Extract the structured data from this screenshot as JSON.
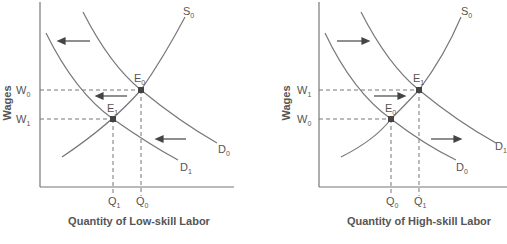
{
  "panels": [
    {
      "id": "low-skill",
      "ylabel": "Wages",
      "xlabel": "Quantity of Low-skill Labor",
      "supply": {
        "label": "S",
        "sub": "0"
      },
      "demand_orig": {
        "label": "D",
        "sub": "0"
      },
      "demand_new": {
        "label": "D",
        "sub": "1"
      },
      "eq_upper": {
        "label": "E",
        "sub": "0"
      },
      "eq_lower": {
        "label": "E",
        "sub": "1"
      },
      "w_upper": {
        "label": "W",
        "sub": "0"
      },
      "w_lower": {
        "label": "W",
        "sub": "1"
      },
      "q_left": {
        "label": "Q",
        "sub": "1"
      },
      "q_right": {
        "label": "Q",
        "sub": "0"
      },
      "shift_direction": "left"
    },
    {
      "id": "high-skill",
      "ylabel": "Wages",
      "xlabel": "Quantity of High-skill Labor",
      "supply": {
        "label": "S",
        "sub": "0"
      },
      "demand_orig": {
        "label": "D",
        "sub": "0"
      },
      "demand_new": {
        "label": "D",
        "sub": "1"
      },
      "eq_upper": {
        "label": "E",
        "sub": "1"
      },
      "eq_lower": {
        "label": "E",
        "sub": "0"
      },
      "w_upper": {
        "label": "W",
        "sub": "1"
      },
      "w_lower": {
        "label": "W",
        "sub": "0"
      },
      "q_left": {
        "label": "Q",
        "sub": "0"
      },
      "q_right": {
        "label": "Q",
        "sub": "1"
      },
      "shift_direction": "right"
    }
  ],
  "colors": {
    "line": "#666666",
    "point": "#444444",
    "text": "#555555"
  }
}
